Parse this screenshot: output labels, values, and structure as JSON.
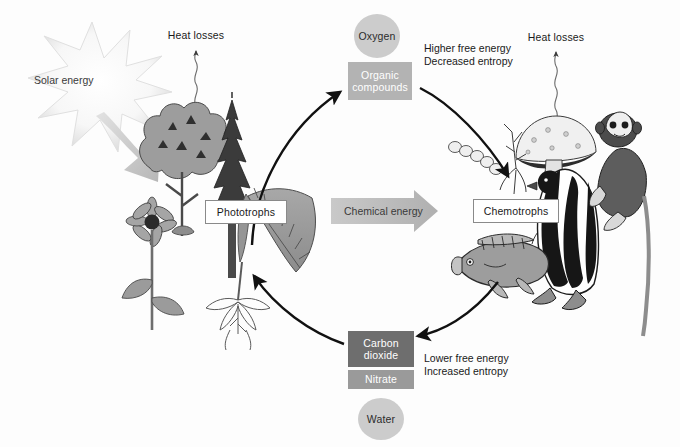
{
  "diagram": {
    "background_color": "#fdfdfd"
  },
  "labels": {
    "solar_energy": "Solar energy",
    "heat_losses_left": "Heat losses",
    "heat_losses_right": "Heat losses",
    "phototrophs": "Phototrophs",
    "chemotrophs": "Chemotrophs",
    "oxygen": "Oxygen",
    "organic_compounds": "Organic\ncompounds",
    "chemical_energy": "Chemical energy",
    "carbon_dioxide": "Carbon\ndioxide",
    "nitrate": "Nitrate",
    "water": "Water"
  },
  "annotations": {
    "top_right": "Higher free energy\nDecreased entropy",
    "bottom_right": "Lower free energy\nIncreased entropy"
  },
  "colors": {
    "oxygen_fill": "#cccccc",
    "organic_fill": "#b3b3b3",
    "carbon_dioxide_fill": "#6e6e6e",
    "nitrate_fill": "#9a9a9a",
    "water_fill": "#cccccc",
    "chemical_energy_fill": "#c2c2c2",
    "arrow_stroke": "#111111",
    "box_border": "#8a8a8a",
    "text_dark": "#1a1a1a",
    "text_light": "#ffffff"
  },
  "illustrations": {
    "phototrophs_group": [
      "deciduous-tree",
      "conifer-tree",
      "sunflower",
      "fern",
      "dandelion"
    ],
    "chemotrophs_group": [
      "bacteria-chain",
      "mushroom",
      "penguin",
      "monkey",
      "fish"
    ]
  },
  "icons": {
    "starburst": "sun-burst-icon",
    "heat_wave": "wavy-heat-arrow-icon",
    "cycle_arrow": "curved-cycle-arrow-icon",
    "block_arrow": "block-arrow-right-icon"
  }
}
